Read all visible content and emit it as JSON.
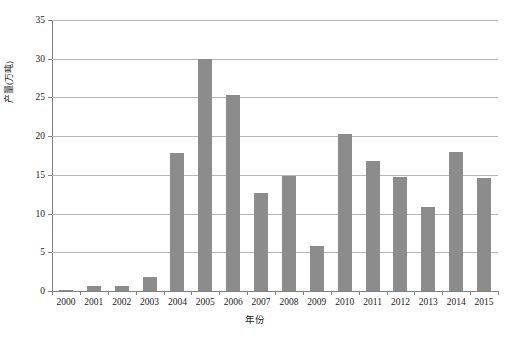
{
  "chart_data": {
    "type": "bar",
    "title": "",
    "xlabel": "年份",
    "ylabel": "产量(万吨)",
    "categories": [
      "2000",
      "2001",
      "2002",
      "2003",
      "2004",
      "2005",
      "2006",
      "2007",
      "2008",
      "2009",
      "2010",
      "2011",
      "2012",
      "2013",
      "2014",
      "2015"
    ],
    "values": [
      0.15,
      0.6,
      0.7,
      1.8,
      17.8,
      30.0,
      25.3,
      12.7,
      14.9,
      5.8,
      20.3,
      16.8,
      14.7,
      10.8,
      17.9,
      14.6
    ],
    "ylim": [
      0,
      35
    ],
    "yticks": [
      0,
      5,
      10,
      15,
      20,
      25,
      30,
      35
    ],
    "ytick_labels": [
      "0",
      "5",
      "10",
      "15",
      "20",
      "25",
      "30",
      "35"
    ],
    "grid": true,
    "legend": "none",
    "bar_color": "#8c8c8c",
    "gridline_color": "#b5b5b5",
    "axis_color": "#808080"
  }
}
